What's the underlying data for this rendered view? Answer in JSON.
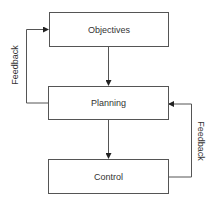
{
  "diagram": {
    "type": "flowchart",
    "nodes": [
      {
        "id": "objectives",
        "label": "Objectives"
      },
      {
        "id": "planning",
        "label": "Planning"
      },
      {
        "id": "control",
        "label": "Control"
      }
    ],
    "edges": [
      {
        "from": "objectives",
        "to": "planning",
        "label": ""
      },
      {
        "from": "planning",
        "to": "control",
        "label": ""
      },
      {
        "from": "planning",
        "to": "objectives",
        "label": "Feedback"
      },
      {
        "from": "control",
        "to": "planning",
        "label": "Feedback"
      }
    ],
    "feedback_left_label": "Feedback",
    "feedback_right_label": "Feedback"
  },
  "colors": {
    "line": "#555555",
    "text": "#333333",
    "background": "#ffffff"
  }
}
